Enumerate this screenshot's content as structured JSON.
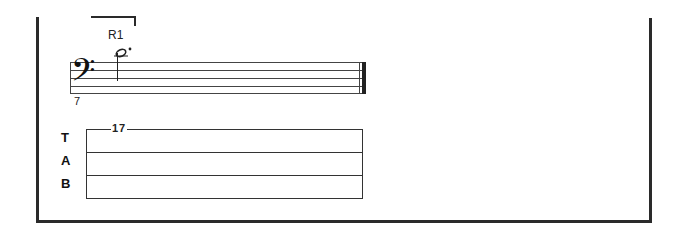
{
  "score": {
    "rehearsal_mark": "R1",
    "measure_number": "7",
    "clef": "bass",
    "clef_glyph": "𝄢",
    "notes": [
      {
        "type": "half",
        "dotted": true,
        "position": "above staff (ledger)"
      }
    ],
    "barline_end": "final double bar"
  },
  "tab": {
    "letters": [
      "T",
      "A",
      "B"
    ],
    "lines": 3,
    "fret_numbers": [
      {
        "string": 1,
        "value": "17"
      }
    ]
  },
  "colors": {
    "ink": "#222222",
    "background": "#ffffff"
  }
}
